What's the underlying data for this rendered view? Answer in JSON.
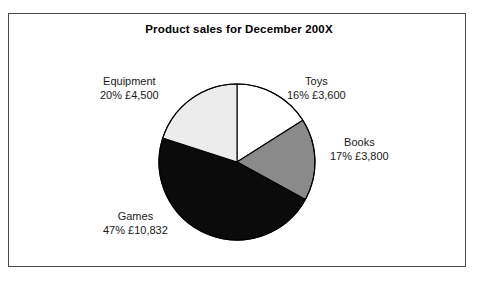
{
  "chart_data": {
    "type": "pie",
    "title": "Product sales for December 200X",
    "xlabel": "",
    "ylabel": "",
    "legend_position": "none",
    "grid": false,
    "categories": [
      "Toys",
      "Books",
      "Games",
      "Equipment"
    ],
    "values": [
      16,
      17,
      47,
      20
    ],
    "value_unit": "percent",
    "amounts": [
      "£3,600",
      "£3,800",
      "£10,832",
      "£4,500"
    ],
    "amounts_numeric": [
      3600,
      3800,
      10832,
      4500
    ],
    "slice_colors": [
      "#ffffff",
      "#8a8a8a",
      "#0b0b0b",
      "#ececec"
    ],
    "start_angle_deg": 0,
    "direction": "clockwise",
    "slices": [
      {
        "name": "Toys",
        "percent_label": "16%",
        "amount_label": "£3,600",
        "value": 16,
        "color": "#ffffff"
      },
      {
        "name": "Books",
        "percent_label": "17%",
        "amount_label": "£3,800",
        "value": 17,
        "color": "#8a8a8a"
      },
      {
        "name": "Games",
        "percent_label": "47%",
        "amount_label": "£10,832",
        "value": 47,
        "color": "#0b0b0b"
      },
      {
        "name": "Equipment",
        "percent_label": "20%",
        "amount_label": "£4,500",
        "value": 20,
        "color": "#ececec"
      }
    ]
  },
  "chart": {
    "title": "Product sales for December 200X",
    "labels": {
      "toys": {
        "name": "Toys",
        "value": "16% £3,600"
      },
      "books": {
        "name": "Books",
        "value": "17% £3,800"
      },
      "games": {
        "name": "Games",
        "value": "47% £10,832"
      },
      "equipment": {
        "name": "Equipment",
        "value": "20% £4,500"
      }
    }
  },
  "style": {
    "frame_border_color": "#4a4a4a",
    "background": "#ffffff",
    "text_color": "#1a1a1a",
    "pie_outline_color": "#000000"
  }
}
